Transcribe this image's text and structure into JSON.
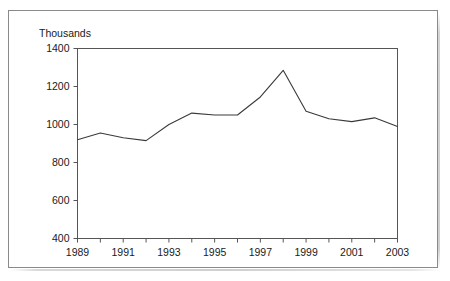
{
  "figure": {
    "unit_label": "Thousands",
    "ghost_top_text": "",
    "frame_color": "#8a8a8a",
    "line_color": "#3a3a3a",
    "axis_color": "#555555",
    "text_color": "#1a1a1a"
  },
  "chart_data": {
    "type": "line",
    "title": "",
    "subtitle": "",
    "xlabel": "",
    "ylabel": "Thousands",
    "x": [
      1989,
      1990,
      1991,
      1992,
      1993,
      1994,
      1995,
      1996,
      1997,
      1998,
      1999,
      2000,
      2001,
      2002,
      2003
    ],
    "values": [
      920,
      955,
      930,
      915,
      1000,
      1060,
      1050,
      1050,
      1145,
      1285,
      1070,
      1030,
      1015,
      1035,
      990
    ],
    "series": [
      {
        "name": "Thousands",
        "values": [
          920,
          955,
          930,
          915,
          1000,
          1060,
          1050,
          1050,
          1145,
          1285,
          1070,
          1030,
          1015,
          1035,
          990
        ]
      }
    ],
    "ylim": [
      400,
      1400
    ],
    "yticks": [
      400,
      600,
      800,
      1000,
      1200,
      1400
    ],
    "ytick_labels": [
      "400",
      "600",
      "800",
      "1000",
      "1200",
      "1400"
    ],
    "xlim": [
      1989,
      2003
    ],
    "xticks": [
      1989,
      1990,
      1991,
      1992,
      1993,
      1994,
      1995,
      1996,
      1997,
      1998,
      1999,
      2000,
      2001,
      2002,
      2003
    ],
    "xtick_labels_shown": [
      "1989",
      "1991",
      "1993",
      "1995",
      "1997",
      "1999",
      "2001",
      "2003"
    ],
    "xtick_label_values": [
      1989,
      1991,
      1993,
      1995,
      1997,
      1999,
      2001,
      2003
    ],
    "grid": false,
    "legend": false,
    "legend_position": "none"
  }
}
